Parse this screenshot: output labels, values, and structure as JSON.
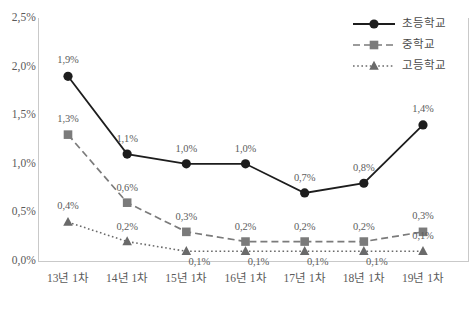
{
  "chart_data": {
    "type": "line",
    "title": "",
    "subtitle": "",
    "xlabel": "",
    "ylabel": "",
    "categories": [
      "13년 1차",
      "14년 1차",
      "15년 1차",
      "16년 1차",
      "17년 1차",
      "18년 1차",
      "19년 1차"
    ],
    "ylim": [
      0.0,
      2.5
    ],
    "y_ticks": [
      "0,0%",
      "0,5%",
      "1,0%",
      "1,5%",
      "2,0%",
      "2,5%"
    ],
    "y_tick_values": [
      0.0,
      0.5,
      1.0,
      1.5,
      2.0,
      2.5
    ],
    "grid": false,
    "legend_position": "top-right",
    "series": [
      {
        "name": "초등학교",
        "marker": "circle",
        "line_style": "solid",
        "color": "#1d1d1d",
        "values": [
          1.9,
          1.1,
          1.0,
          1.0,
          0.7,
          0.8,
          1.4
        ],
        "labels": [
          "1,9%",
          "1,1%",
          "1,0%",
          "1,0%",
          "0,7%",
          "0,8%",
          "1,4%"
        ]
      },
      {
        "name": "중학교",
        "marker": "square",
        "line_style": "dashed",
        "color": "#7b7b7b",
        "values": [
          1.3,
          0.6,
          0.3,
          0.2,
          0.2,
          0.2,
          0.3
        ],
        "labels": [
          "1,3%",
          "0,6%",
          "0,3%",
          "0,2%",
          "0,2%",
          "0,2%",
          "0,3%"
        ]
      },
      {
        "name": "고등학교",
        "marker": "triangle",
        "line_style": "dotted",
        "color": "#6a6a6a",
        "values": [
          0.4,
          0.2,
          0.1,
          0.1,
          0.1,
          0.1,
          0.1
        ],
        "labels": [
          "0,4%",
          "0,2%",
          "0,1%",
          "0,1%",
          "0,1%",
          "0,1%",
          "0,1%"
        ]
      }
    ]
  },
  "legend": {
    "items": [
      {
        "label": "초등학교",
        "icon": "solid-line-circle-marker-icon"
      },
      {
        "label": "중학교",
        "icon": "dashed-line-square-marker-icon"
      },
      {
        "label": "고등학교",
        "icon": "dotted-line-triangle-marker-icon"
      }
    ]
  },
  "colors": {
    "series_primary": "#1d1d1d",
    "series_secondary": "#7b7b7b",
    "series_tertiary": "#6a6a6a",
    "axis": "#c9c9c9",
    "text": "#5a5a5a"
  }
}
